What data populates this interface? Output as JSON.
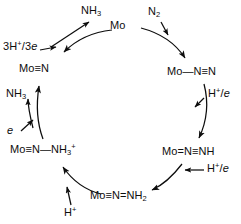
{
  "diagram": {
    "type": "cycle",
    "stroke_color": "#0d0d0d",
    "background_color": "#ffffff",
    "nodes": [
      {
        "id": "mo",
        "label": "Mo",
        "x": 120,
        "y": 26,
        "role": "cycle-node"
      },
      {
        "id": "mo-n2",
        "label": "Mo—N≡N",
        "x": 196,
        "y": 72,
        "role": "cycle-node"
      },
      {
        "id": "mo-nnh",
        "label": "Mo=N≡NH",
        "x": 190,
        "y": 152,
        "role": "cycle-node"
      },
      {
        "id": "mo-nnh2",
        "label": "Mo≡N=NH₂",
        "x": 120,
        "y": 196,
        "role": "cycle-node"
      },
      {
        "id": "mo-n-nh3",
        "label": "Mo≡N—NH₃⁺",
        "x": 48,
        "y": 150,
        "role": "cycle-node"
      },
      {
        "id": "mo-nitride",
        "label": "Mo≡N",
        "x": 38,
        "y": 70,
        "role": "cycle-node"
      }
    ],
    "reagents": [
      {
        "id": "n2",
        "label": "N₂",
        "x": 155,
        "y": 8,
        "role": "reactant-in"
      },
      {
        "id": "nh3-top",
        "label": "NH₃",
        "x": 86,
        "y": 7,
        "role": "product-out"
      },
      {
        "id": "h3-3e",
        "label": "3H⁺/3e",
        "x": 4,
        "y": 42,
        "role": "reactant-in"
      },
      {
        "id": "nh3-left",
        "label": "NH₃",
        "x": 8,
        "y": 90,
        "role": "product-out"
      },
      {
        "id": "e-left",
        "label": "e",
        "x": 8,
        "y": 126,
        "role": "reactant-in"
      },
      {
        "id": "h-plus",
        "label": "H⁺",
        "x": 68,
        "y": 208,
        "role": "reactant-in"
      },
      {
        "id": "h-e-lower",
        "label": "H⁺/e",
        "x": 206,
        "y": 166,
        "role": "reactant-in"
      },
      {
        "id": "h-e-upper",
        "label": "H⁺/e",
        "x": 208,
        "y": 90,
        "role": "reactant-in"
      }
    ],
    "node_labels": {
      "mo": "Mo",
      "mo_n2": "Mo—N≡N",
      "mo_nnh": "Mo=N≡NH",
      "mo_nnh2": "Mo≡N=NH₂",
      "mo_n_nh3": "Mo≡N—NH₃⁺",
      "mo_nitride": "Mo≡N"
    },
    "parts": {
      "mo": "Mo",
      "n": "N",
      "nh": "NH",
      "nh_sub2": "2",
      "nh_sub3": "3",
      "plus": "+",
      "three": "3",
      "h": "H",
      "e": "e",
      "slash": "/",
      "three_e": "3e",
      "n_sub2": "2",
      "single_bond": "—",
      "triple_bond": "≡",
      "double_bond": "=",
      "n2_label": "N",
      "nh3_label": "NH"
    }
  }
}
